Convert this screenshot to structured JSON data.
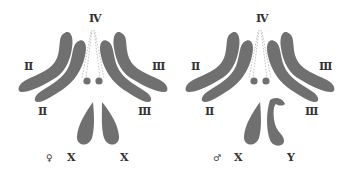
{
  "figures": [
    {
      "name": "female-karyotype",
      "sex_symbol": "♀",
      "labels": {
        "top": "Ⅳ",
        "left_outer": "Ⅱ",
        "left_inner": "Ⅱ",
        "right_outer": "Ⅲ",
        "right_inner": "Ⅲ",
        "sex_left": "X",
        "sex_right": "X"
      }
    },
    {
      "name": "male-karyotype",
      "sex_symbol": "♂",
      "labels": {
        "top": "Ⅳ",
        "left_outer": "Ⅱ",
        "left_inner": "Ⅱ",
        "right_outer": "Ⅲ",
        "right_inner": "Ⅲ",
        "sex_left": "X",
        "sex_right": "Y"
      }
    }
  ],
  "colors": {
    "chromosome": "#707070",
    "label": "#333333"
  }
}
